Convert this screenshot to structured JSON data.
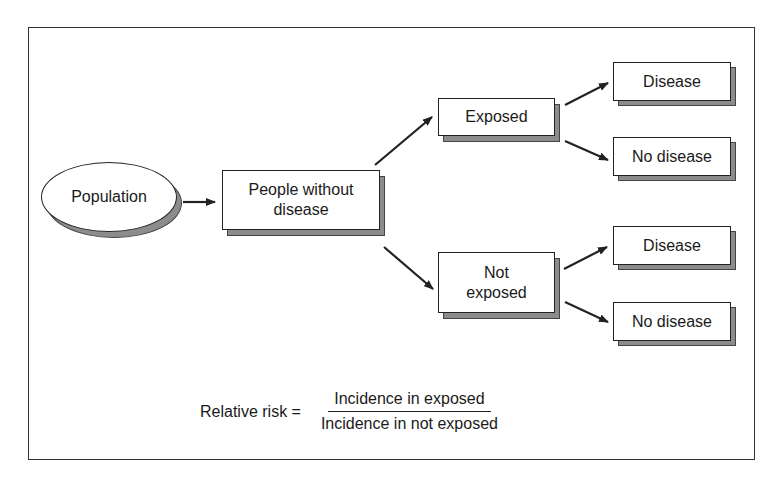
{
  "diagram": {
    "nodes": {
      "population": {
        "label": "Population",
        "shape": "ellipse"
      },
      "people_without_disease": {
        "label": "People without disease",
        "line1": "People without",
        "line2": "disease"
      },
      "exposed": {
        "label": "Exposed"
      },
      "not_exposed": {
        "label": "Not exposed",
        "line1": "Not",
        "line2": "exposed"
      },
      "exposed_disease": {
        "label": "Disease"
      },
      "exposed_no_disease": {
        "label": "No disease"
      },
      "not_exposed_disease": {
        "label": "Disease"
      },
      "not_exposed_no_disease": {
        "label": "No disease"
      }
    },
    "edges": [
      {
        "from": "population",
        "to": "people_without_disease"
      },
      {
        "from": "people_without_disease",
        "to": "exposed"
      },
      {
        "from": "people_without_disease",
        "to": "not_exposed"
      },
      {
        "from": "exposed",
        "to": "exposed_disease"
      },
      {
        "from": "exposed",
        "to": "exposed_no_disease"
      },
      {
        "from": "not_exposed",
        "to": "not_exposed_disease"
      },
      {
        "from": "not_exposed",
        "to": "not_exposed_no_disease"
      }
    ],
    "formula": {
      "label": "Relative risk =",
      "numerator": "Incidence in exposed",
      "denominator": "Incidence in not exposed"
    },
    "colors": {
      "line": "#222222",
      "shadow": "#8c8c8c",
      "background": "#ffffff"
    }
  }
}
